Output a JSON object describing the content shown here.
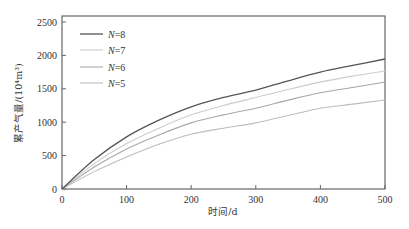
{
  "chart_data": {
    "type": "line",
    "title": "",
    "xlabel": "时间/d",
    "ylabel": "累产气量/(10⁴m³)",
    "xlim": [
      0,
      500
    ],
    "ylim": [
      0,
      2500
    ],
    "xticks": [
      0,
      100,
      200,
      300,
      400,
      500
    ],
    "yticks": [
      0,
      500,
      1000,
      1500,
      2000,
      2500
    ],
    "grid": false,
    "legend_position": "upper-left",
    "x": [
      0,
      50,
      100,
      150,
      200,
      250,
      300,
      350,
      400,
      450,
      500
    ],
    "series": [
      {
        "name": "N=8",
        "label_var": "N",
        "label_val": "=8",
        "color": "#555555",
        "values": [
          0,
          440,
          780,
          1030,
          1230,
          1370,
          1480,
          1620,
          1750,
          1850,
          1946
        ]
      },
      {
        "name": "N=7",
        "label_var": "N",
        "label_val": "=7",
        "color": "#cccccc",
        "values": [
          0,
          380,
          680,
          910,
          1110,
          1250,
          1370,
          1490,
          1600,
          1690,
          1766
        ]
      },
      {
        "name": "N=6",
        "label_var": "N",
        "label_val": "=6",
        "color": "#a8a8a8",
        "values": [
          0,
          330,
          600,
          810,
          990,
          1110,
          1210,
          1330,
          1440,
          1520,
          1602
        ]
      },
      {
        "name": "N=5",
        "label_var": "N",
        "label_val": "=5",
        "color": "#bdbdbd",
        "values": [
          0,
          260,
          480,
          670,
          820,
          910,
          990,
          1100,
          1210,
          1270,
          1332
        ]
      }
    ]
  },
  "layout": {
    "plot": {
      "left": 62,
      "top": 16,
      "right": 385,
      "bottom": 189
    },
    "frame_color": "#666666"
  }
}
